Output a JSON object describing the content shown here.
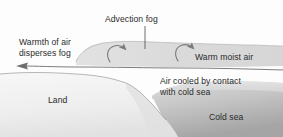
{
  "figure": {
    "type": "cross-section-diagram"
  },
  "labels": {
    "advection_fog": "Advection fog",
    "warmth_line1": "Warmth of air",
    "warmth_line2": "disperses fog",
    "warm_moist_air": "Warm moist air",
    "air_cooled_line1": "Air cooled by contact",
    "air_cooled_line2": "with cold sea",
    "land": "Land",
    "cold_sea": "Cold sea"
  },
  "colors": {
    "background": "#fdfdfd",
    "fog": "#dcdcdc",
    "fog_edge": "#8f8f8f",
    "land_light": "#f4f4f4",
    "land_shade": "#e3e3e3",
    "sea_light": "#d2d2d2",
    "sea_dark": "#a8a8a8",
    "text": "#2b2b2b",
    "stroke": "#6e6e6e",
    "arrow": "#7a7a7a"
  },
  "annotations": {
    "leader_line": "advection-fog-leader",
    "arrows": [
      {
        "name": "fog-swirl-arrow-left",
        "direction": "curl-up-right"
      },
      {
        "name": "fog-swirl-arrow-right",
        "direction": "curl-up-right"
      },
      {
        "name": "warm-air-flow-arrow",
        "direction": "left"
      }
    ]
  }
}
